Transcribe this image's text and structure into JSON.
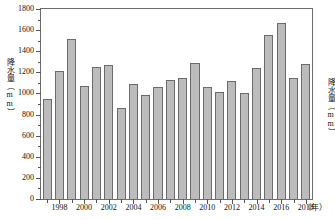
{
  "chart_data": {
    "type": "bar",
    "title": "",
    "xlabel": "年",
    "ylabel": "降水量（mm）",
    "ylabel_right": "降水量（mm）",
    "ylim": [
      0,
      1800
    ],
    "ytick_step": 200,
    "yticks": [
      0,
      200,
      400,
      600,
      800,
      1000,
      1200,
      1400,
      1600,
      1800
    ],
    "ytick_labels": [
      "0",
      "200",
      "400",
      "600",
      "800",
      "1000",
      "1200",
      "1400",
      "1600",
      "1800"
    ],
    "grid": false,
    "legend": null,
    "bar_color": "#bcbcbc",
    "bar_edge_color": "#6b6b6b",
    "axis_color": "#6d6d6d",
    "categories": [
      "1997",
      "1998",
      "1999",
      "2000",
      "2001",
      "2002",
      "2003",
      "2004",
      "2005",
      "2006",
      "2007",
      "2008",
      "2009",
      "2010",
      "2011",
      "2012",
      "2013",
      "2014",
      "2015",
      "2016",
      "2017",
      "2018"
    ],
    "values": [
      950,
      1210,
      1520,
      1075,
      1250,
      1265,
      865,
      1085,
      985,
      1060,
      1125,
      1150,
      1285,
      1065,
      1010,
      1115,
      1008,
      1240,
      1550,
      1665,
      1150,
      1275
    ],
    "xtick_labels": [
      "1998",
      "2000",
      "2002",
      "2004",
      "2006",
      "2008",
      "2010",
      "2012",
      "2014",
      "2016",
      "2018"
    ],
    "xtick_unit": "（年）"
  }
}
